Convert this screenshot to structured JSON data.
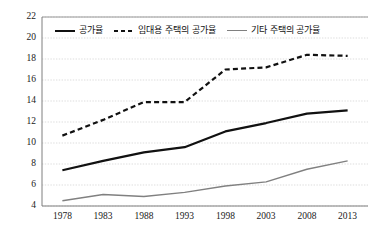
{
  "chart_data": {
    "type": "line",
    "title": "",
    "xlabel": "",
    "ylabel": "",
    "categories": [
      "1978",
      "1983",
      "1988",
      "1993",
      "1998",
      "2003",
      "2008",
      "2013"
    ],
    "xlim": [
      "1978",
      "2013"
    ],
    "ylim": [
      4,
      22
    ],
    "yticks": [
      22,
      20,
      18,
      16,
      14,
      12,
      10,
      8,
      6,
      4
    ],
    "grid": "horizontal-dotted",
    "legend_position": "top-left-inside",
    "series": [
      {
        "name": "공가율",
        "style": "solid",
        "color": "#111111",
        "width": 2.2,
        "values": [
          7.4,
          8.3,
          9.1,
          9.6,
          11.1,
          11.9,
          12.8,
          13.1
        ]
      },
      {
        "name": "임대용 주택의 공가율",
        "style": "dashed",
        "color": "#111111",
        "width": 2.2,
        "values": [
          10.7,
          12.2,
          13.9,
          13.9,
          17.0,
          17.2,
          18.4,
          18.3
        ]
      },
      {
        "name": "기타 주택의 공가율",
        "style": "solid",
        "color": "#808080",
        "width": 1.4,
        "values": [
          4.5,
          5.1,
          4.9,
          5.3,
          5.9,
          6.3,
          7.5,
          8.3
        ]
      }
    ]
  },
  "axis": {
    "y_labels": [
      "22",
      "20",
      "18",
      "16",
      "14",
      "12",
      "10",
      "8",
      "6",
      "4"
    ],
    "x_labels": [
      "1978",
      "1983",
      "1988",
      "1993",
      "1998",
      "2003",
      "2008",
      "2013"
    ]
  },
  "legend": {
    "items": [
      {
        "label": "공가율",
        "swatch": "solid-dark-line-icon"
      },
      {
        "label": "임대용 주택의 공가율",
        "swatch": "dashed-line-icon"
      },
      {
        "label": "기타 주택의 공가율",
        "swatch": "solid-gray-line-icon"
      }
    ]
  },
  "colors": {
    "plot_border": "#7f7f7f",
    "gridline": "#d9d9d9",
    "text": "#1a1a1a",
    "series_primary": "#111111",
    "series_tertiary": "#808080",
    "background": "#ffffff"
  }
}
